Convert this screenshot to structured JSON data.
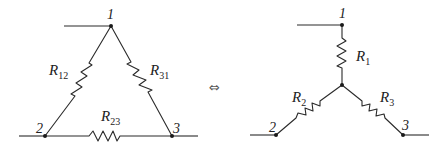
{
  "delta": {
    "nodes": [
      {
        "label": "1"
      },
      {
        "label": "2"
      },
      {
        "label": "3"
      }
    ],
    "resistors": [
      {
        "symbol": "R",
        "sub": "12"
      },
      {
        "symbol": "R",
        "sub": "31"
      },
      {
        "symbol": "R",
        "sub": "23"
      }
    ]
  },
  "equivalence_symbol": "⇔",
  "star": {
    "nodes": [
      {
        "label": "1"
      },
      {
        "label": "2"
      },
      {
        "label": "3"
      }
    ],
    "resistors": [
      {
        "symbol": "R",
        "sub": "1"
      },
      {
        "symbol": "R",
        "sub": "2"
      },
      {
        "symbol": "R",
        "sub": "3"
      }
    ]
  }
}
